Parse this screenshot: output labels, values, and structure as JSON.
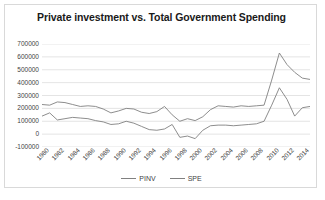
{
  "chart_data": {
    "type": "line",
    "title": "Private investment vs. Total Government Spending",
    "xlabel": "",
    "ylabel": "",
    "ylim": [
      -100000,
      700000
    ],
    "ytick_labels": [
      "700000",
      "600000",
      "500000",
      "400000",
      "300000",
      "200000",
      "100000",
      "0",
      "-100000"
    ],
    "ytick_values": [
      700000,
      600000,
      500000,
      400000,
      300000,
      200000,
      100000,
      0,
      -100000
    ],
    "grid": true,
    "legend_position": "bottom",
    "x": [
      1980,
      1981,
      1982,
      1983,
      1984,
      1985,
      1986,
      1987,
      1988,
      1989,
      1990,
      1991,
      1992,
      1993,
      1994,
      1995,
      1996,
      1997,
      1998,
      1999,
      2000,
      2001,
      2002,
      2003,
      2004,
      2005,
      2006,
      2007,
      2008,
      2009,
      2010,
      2011,
      2012,
      2013,
      2014,
      2015
    ],
    "xtick_labels": [
      "1980",
      "1982",
      "1984",
      "1986",
      "1988",
      "1990",
      "1992",
      "1994",
      "1996",
      "1998",
      "2000",
      "2002",
      "2004",
      "2006",
      "2008",
      "2010",
      "2012",
      "2014"
    ],
    "series": [
      {
        "name": "PINV",
        "color": "#808080",
        "values": [
          140000,
          165000,
          110000,
          120000,
          130000,
          125000,
          120000,
          105000,
          95000,
          75000,
          80000,
          100000,
          85000,
          60000,
          35000,
          30000,
          40000,
          75000,
          -25000,
          -15000,
          -35000,
          30000,
          65000,
          70000,
          70000,
          65000,
          70000,
          75000,
          80000,
          100000,
          225000,
          360000,
          270000,
          140000,
          205000,
          215000
        ]
      },
      {
        "name": "SPE",
        "color": "#808080",
        "values": [
          230000,
          225000,
          250000,
          245000,
          230000,
          215000,
          220000,
          215000,
          195000,
          165000,
          180000,
          200000,
          195000,
          170000,
          160000,
          175000,
          215000,
          150000,
          100000,
          120000,
          105000,
          135000,
          190000,
          220000,
          215000,
          210000,
          220000,
          215000,
          220000,
          225000,
          420000,
          630000,
          540000,
          480000,
          435000,
          425000
        ]
      }
    ]
  },
  "legend": {
    "items": [
      {
        "label": "PINV"
      },
      {
        "label": "SPE"
      }
    ]
  }
}
